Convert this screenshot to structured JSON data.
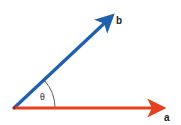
{
  "diagram": {
    "vectors": [
      {
        "name": "a",
        "label": "a",
        "color": "#e8401c",
        "from": [
          14,
          108
        ],
        "to": [
          168,
          108
        ]
      },
      {
        "name": "b",
        "label": "b",
        "color": "#1f5fae",
        "from": [
          14,
          108
        ],
        "to": [
          116,
          12
        ]
      }
    ],
    "angle": {
      "label": "θ",
      "between": [
        "a",
        "b"
      ],
      "arc_color": "#333333"
    }
  }
}
